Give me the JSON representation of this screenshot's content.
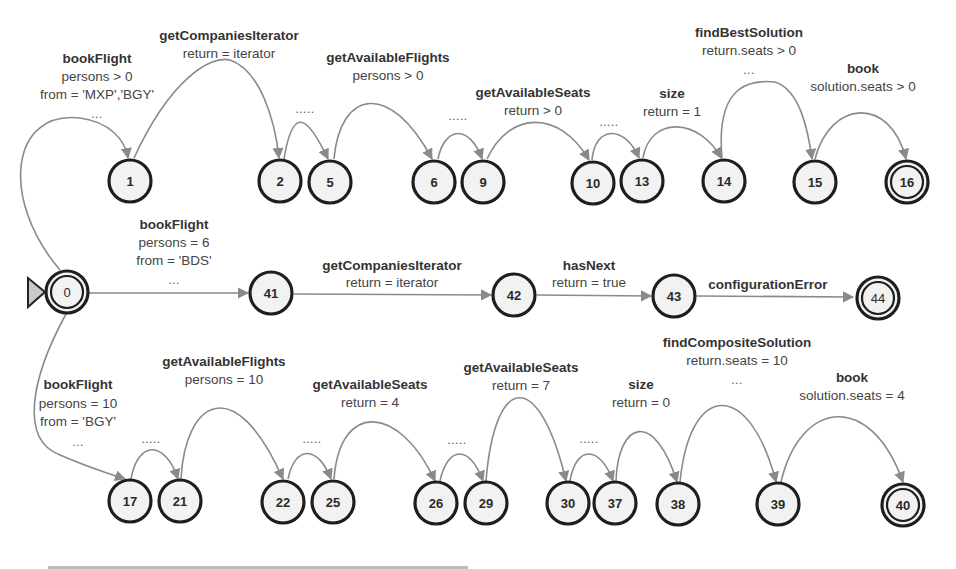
{
  "diagram": {
    "type": "finite-state-automaton",
    "start_node": "0",
    "colors": {
      "edge": "#8a8a8a",
      "node_stroke": "#1e1e1e",
      "node_fill": "#f2f2f2",
      "start_marker": "#c8c8c8"
    },
    "nodes": {
      "n0": "0",
      "n1": "1",
      "n2": "2",
      "n5": "5",
      "n6": "6",
      "n9": "9",
      "n10": "10",
      "n13": "13",
      "n14": "14",
      "n15": "15",
      "n16": "16",
      "n41": "41",
      "n42": "42",
      "n43": "43",
      "n44": "44",
      "n17": "17",
      "n21": "21",
      "n22": "22",
      "n25": "25",
      "n26": "26",
      "n29": "29",
      "n30": "30",
      "n37": "37",
      "n38": "38",
      "n39": "39",
      "n40": "40"
    },
    "final_nodes": [
      "16",
      "44",
      "40",
      "0"
    ],
    "labels": {
      "top": {
        "bookFlight": {
          "name": "bookFlight",
          "l1": "persons > 0",
          "l2": "from = 'MXP','BGY'",
          "l3": "..."
        },
        "getCompaniesIterator": {
          "name": "getCompaniesIterator",
          "l1": "return = iterator"
        },
        "dots_2_5": ".....",
        "getAvailableFlights": {
          "name": "getAvailableFlights",
          "l1": "persons > 0"
        },
        "dots_6_9": ".....",
        "getAvailableSeats": {
          "name": "getAvailableSeats",
          "l1": "return > 0"
        },
        "dots_10_13": ".....",
        "size": {
          "name": "size",
          "l1": "return = 1"
        },
        "findBestSolution": {
          "name": "findBestSolution",
          "l1": "return.seats > 0",
          "l2": "..."
        },
        "book": {
          "name": "book",
          "l1": "solution.seats > 0"
        }
      },
      "middle": {
        "bookFlight": {
          "name": "bookFlight",
          "l1": "persons = 6",
          "l2": "from = 'BDS'",
          "l3": "..."
        },
        "getCompaniesIterator": {
          "name": "getCompaniesIterator",
          "l1": "return = iterator"
        },
        "hasNext": {
          "name": "hasNext",
          "l1": "return = true"
        },
        "configurationError": {
          "name": "configurationError"
        }
      },
      "bottom": {
        "bookFlight": {
          "name": "bookFlight",
          "l1": "persons = 10",
          "l2": "from = 'BGY'",
          "l3": "..."
        },
        "dots_17_21": ".....",
        "getAvailableFlights": {
          "name": "getAvailableFlights",
          "l1": "persons = 10"
        },
        "dots_22_25": ".....",
        "getAvailableSeats_a": {
          "name": "getAvailableSeats",
          "l1": "return = 4"
        },
        "dots_26_29": ".....",
        "getAvailableSeats_b": {
          "name": "getAvailableSeats",
          "l1": "return = 7"
        },
        "dots_30_37": ".....",
        "size": {
          "name": "size",
          "l1": "return = 0"
        },
        "findCompositeSolution": {
          "name": "findCompositeSolution",
          "l1": "return.seats = 10",
          "l2": "..."
        },
        "book": {
          "name": "book",
          "l1": "solution.seats = 4"
        }
      }
    }
  }
}
